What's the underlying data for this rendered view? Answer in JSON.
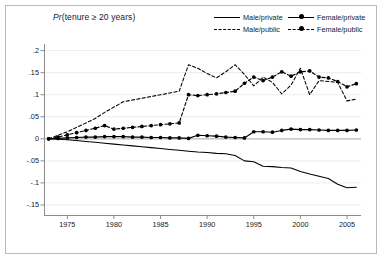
{
  "chart_data": {
    "type": "line",
    "title": "Pr(tenure ≥ 20 years)",
    "title_prefix": "Pr",
    "title_rest": "(tenure ≥ 20 years)",
    "xlabel": "",
    "ylabel": "",
    "xlim": [
      1972.5,
      2006.5
    ],
    "ylim": [
      -0.175,
      0.215
    ],
    "grid": true,
    "grid_axis": "y",
    "legend_position": "top-right",
    "xticks": [
      1975,
      1980,
      1985,
      1990,
      1995,
      2000,
      2005
    ],
    "xtick_labels": [
      "1975",
      "1980",
      "1985",
      "1990",
      "1995",
      "2000",
      "2005"
    ],
    "yticks": [
      0.2,
      0.15,
      0.1,
      0.05,
      0,
      -0.05,
      -0.1,
      -0.15
    ],
    "ytick_labels": [
      ".2",
      ".15",
      ".1",
      ".05",
      "0",
      "-.05",
      "-.1",
      "-.15"
    ],
    "x": [
      1973,
      1974,
      1975,
      1976,
      1977,
      1978,
      1979,
      1980,
      1981,
      1982,
      1983,
      1984,
      1985,
      1986,
      1987,
      1988,
      1989,
      1990,
      1991,
      1992,
      1993,
      1994,
      1995,
      1996,
      1997,
      1998,
      1999,
      2000,
      2001,
      2002,
      2003,
      2004,
      2005,
      2006
    ],
    "series": [
      {
        "name": "Male/private",
        "key": "male_private",
        "style": "solid",
        "marker": "none",
        "color": "#000000",
        "values": [
          0.0,
          -0.001,
          -0.002,
          -0.004,
          -0.006,
          -0.008,
          -0.01,
          -0.012,
          -0.014,
          -0.016,
          -0.018,
          -0.02,
          -0.022,
          -0.024,
          -0.026,
          -0.028,
          -0.03,
          -0.031,
          -0.033,
          -0.034,
          -0.038,
          -0.05,
          -0.052,
          -0.062,
          -0.063,
          -0.065,
          -0.066,
          -0.074,
          -0.08,
          -0.085,
          -0.09,
          -0.103,
          -0.111,
          -0.11
        ]
      },
      {
        "name": "Male/public",
        "key": "male_public",
        "style": "dashed",
        "marker": "none",
        "color": "#000000",
        "values": [
          0.0,
          0.008,
          0.016,
          0.026,
          0.036,
          0.046,
          0.06,
          0.072,
          0.084,
          0.088,
          0.092,
          0.096,
          0.1,
          0.104,
          0.108,
          0.168,
          0.16,
          0.148,
          0.138,
          0.152,
          0.168,
          0.146,
          0.12,
          0.14,
          0.128,
          0.102,
          0.122,
          0.16,
          0.1,
          0.132,
          0.13,
          0.128,
          0.086,
          0.09
        ]
      },
      {
        "name": "Female/private",
        "key": "female_private",
        "style": "solid",
        "marker": "circle",
        "color": "#000000",
        "values": [
          0.0,
          0.001,
          0.002,
          0.003,
          0.004,
          0.004,
          0.005,
          0.005,
          0.005,
          0.004,
          0.004,
          0.003,
          0.003,
          0.002,
          0.002,
          0.001,
          0.008,
          0.007,
          0.006,
          0.004,
          0.003,
          0.002,
          0.016,
          0.016,
          0.015,
          0.019,
          0.022,
          0.021,
          0.021,
          0.02,
          0.019,
          0.019,
          0.019,
          0.02
        ]
      },
      {
        "name": "Female/public",
        "key": "female_public",
        "style": "dashed",
        "marker": "circle",
        "color": "#000000",
        "values": [
          0.0,
          0.004,
          0.009,
          0.014,
          0.019,
          0.024,
          0.03,
          0.022,
          0.024,
          0.026,
          0.028,
          0.03,
          0.032,
          0.034,
          0.036,
          0.1,
          0.098,
          0.1,
          0.102,
          0.105,
          0.108,
          0.126,
          0.14,
          0.132,
          0.14,
          0.152,
          0.142,
          0.152,
          0.154,
          0.14,
          0.138,
          0.13,
          0.118,
          0.125
        ]
      }
    ]
  },
  "legend": {
    "items": [
      {
        "label": "Male/private",
        "style": "solid",
        "marker": false
      },
      {
        "label": "Female/private",
        "style": "solid",
        "marker": true
      },
      {
        "label": "Male/public",
        "style": "dashed",
        "marker": false
      },
      {
        "label": "Female/public",
        "style": "dashed",
        "marker": true
      }
    ]
  },
  "colors": {
    "line": "#000000",
    "grid": "#ededed",
    "axis": "#8c8c8c",
    "frame": "#b9b9b9",
    "background": "#ffffff",
    "text": "#1a1a1a"
  }
}
